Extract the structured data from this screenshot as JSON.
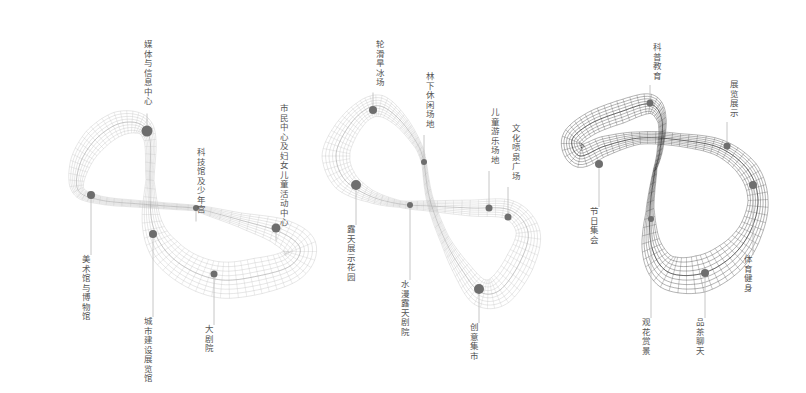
{
  "colors": {
    "background": "#ffffff",
    "mesh_light": "#bdbdbd",
    "mesh_dark": "#3a3a3a",
    "dot": "#6e6e6e",
    "leader": "#b8b8b8",
    "label": "#555555"
  },
  "diagrams": [
    {
      "id": "loop-1",
      "style": "light",
      "description": "Figure-eight twisted ribbon mesh with cultural facility nodes",
      "nodes": [
        {
          "label": "媒体与信息中心",
          "dot": [
            147,
            131
          ],
          "r": 5.5,
          "label_pos": [
            147,
            40
          ],
          "label_anchor": "top"
        },
        {
          "label": "科技馆及少年宫",
          "dot": [
            196,
            208
          ],
          "r": 3,
          "label_pos": [
            200,
            148
          ],
          "label_anchor": "top"
        },
        {
          "label": "市民中心及妇女儿童活动中心",
          "dot": [
            276,
            228
          ],
          "r": 4.5,
          "label_pos": [
            283,
            104
          ],
          "label_anchor": "top"
        },
        {
          "label": "美术馆与博物馆",
          "dot": [
            91,
            195
          ],
          "r": 4,
          "label_pos": [
            85,
            255
          ],
          "label_anchor": "bottom"
        },
        {
          "label": "城市建设展览馆",
          "dot": [
            153,
            234
          ],
          "r": 4,
          "label_pos": [
            147,
            317
          ],
          "label_anchor": "bottom"
        },
        {
          "label": "大剧院",
          "dot": [
            214,
            274
          ],
          "r": 3.5,
          "label_pos": [
            208,
            325
          ],
          "label_anchor": "bottom"
        }
      ]
    },
    {
      "id": "loop-2",
      "style": "light",
      "description": "Figure-eight twisted ribbon mesh with outdoor recreation nodes",
      "nodes": [
        {
          "label": "轮滑旱冰场",
          "dot": [
            373,
            110
          ],
          "r": 4,
          "label_pos": [
            379,
            40
          ],
          "label_anchor": "top"
        },
        {
          "label": "林下休闲场地",
          "dot": [
            424,
            162
          ],
          "r": 3,
          "label_pos": [
            429,
            72
          ],
          "label_anchor": "top"
        },
        {
          "label": "儿童游乐场地",
          "dot": [
            489,
            208
          ],
          "r": 3.5,
          "label_pos": [
            494,
            108
          ],
          "label_anchor": "top"
        },
        {
          "label": "文化喷泉广场",
          "dot": [
            508,
            217
          ],
          "r": 3.5,
          "label_pos": [
            515,
            124
          ],
          "label_anchor": "top"
        },
        {
          "label": "露天展示花园",
          "dot": [
            356,
            185
          ],
          "r": 5,
          "label_pos": [
            350,
            225
          ],
          "label_anchor": "bottom"
        },
        {
          "label": "水漫露天剧院",
          "dot": [
            410,
            205
          ],
          "r": 3,
          "label_pos": [
            404,
            280
          ],
          "label_anchor": "bottom"
        },
        {
          "label": "创意集市",
          "dot": [
            479,
            289
          ],
          "r": 5,
          "label_pos": [
            473,
            323
          ],
          "label_anchor": "bottom"
        }
      ]
    },
    {
      "id": "loop-3",
      "style": "dark",
      "description": "Figure-eight twisted ribbon mesh with community activity nodes",
      "nodes": [
        {
          "label": "科普教育",
          "dot": [
            650,
            103
          ],
          "r": 3.5,
          "label_pos": [
            656,
            43
          ],
          "label_anchor": "top"
        },
        {
          "label": "展览展示",
          "dot": [
            727,
            146
          ],
          "r": 3.5,
          "label_pos": [
            733,
            80
          ],
          "label_anchor": "top"
        },
        {
          "label": "节日集会",
          "dot": [
            599,
            164
          ],
          "r": 4,
          "label_pos": [
            593,
            207
          ],
          "label_anchor": "bottom"
        },
        {
          "label": "体育健身",
          "dot": [
            753,
            185
          ],
          "r": 4,
          "label_pos": [
            747,
            255
          ],
          "label_anchor": "bottom"
        },
        {
          "label": "观花赏景",
          "dot": [
            651,
            219
          ],
          "r": 3,
          "label_pos": [
            645,
            318
          ],
          "label_anchor": "bottom"
        },
        {
          "label": "品茶聊天",
          "dot": [
            705,
            273
          ],
          "r": 4,
          "label_pos": [
            699,
            318
          ],
          "label_anchor": "bottom"
        }
      ]
    }
  ]
}
